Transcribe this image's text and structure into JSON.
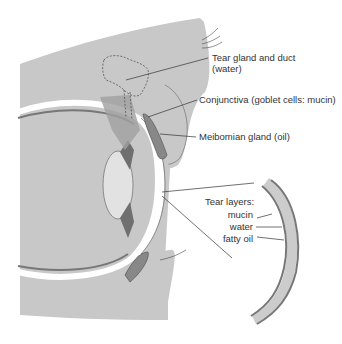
{
  "labels": {
    "tear_gland_line1": "Tear gland and duct",
    "tear_gland_line2": "(water)",
    "conjunctiva": "Conjunctiva (goblet cells: mucin)",
    "meibomian": "Meibomian gland (oil)",
    "tear_layers_title": "Tear layers:",
    "mucin": "mucin",
    "water": "water",
    "fatty_oil": "fatty oil"
  },
  "colors": {
    "tissue": "#c8c8c8",
    "tissue_dark": "#a8a8a8",
    "muscle": "#7a7a7a",
    "outline": "#555555",
    "line": "#333333",
    "white": "#ffffff"
  }
}
